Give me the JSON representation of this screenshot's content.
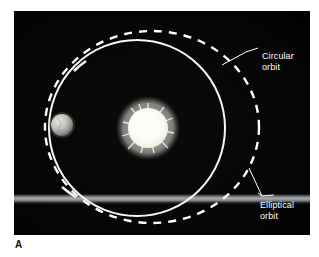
{
  "figure": {
    "letter": "A",
    "panel_background": "#050505",
    "page_background": "#ffffff"
  },
  "diagram": {
    "title": "",
    "type": "orbit-comparison",
    "labels": {
      "circular": "Circular\norbit",
      "elliptical": "Elliptical\norbit"
    },
    "objects": {
      "sun": {
        "name": "sun",
        "center_x": 148,
        "center_y": 128,
        "radius": 20,
        "color": "#ffffff"
      },
      "planet": {
        "name": "planet",
        "center_x": 62,
        "center_y": 125,
        "radius": 11,
        "color": "#c8c8c4"
      }
    },
    "orbits": {
      "circular": {
        "style": "solid",
        "stroke": "#ffffff",
        "center_x": 137,
        "center_y": 128,
        "radius": 89
      },
      "elliptical": {
        "style": "dashed",
        "stroke": "#ffffff",
        "center_x": 152,
        "center_y": 127,
        "radius_x": 107,
        "radius_y": 96
      }
    },
    "leaders": {
      "circular_points": "222,65 246,52 258,48",
      "elliptical_points": "249,168 262,196 259,193"
    }
  }
}
